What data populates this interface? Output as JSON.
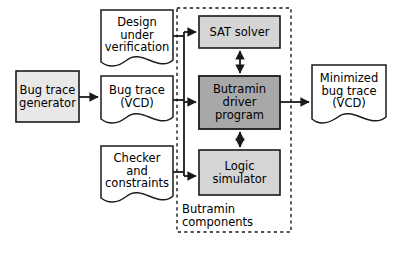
{
  "diagram": {
    "background_color": "#ffffff",
    "stroke_color": "#1a1a1a",
    "nodes": {
      "bug_trace_generator": {
        "label": "Bug trace\ngenerator",
        "shape": "rect",
        "fill": "#e8e8e8",
        "x": 16,
        "y": 71,
        "w": 63,
        "h": 51,
        "font_size": 11.5
      },
      "design_under_verification": {
        "label": "Design\nunder\nverification",
        "shape": "document",
        "fill": "#ffffff",
        "x": 101,
        "y": 10,
        "w": 72,
        "h": 56,
        "font_size": 11.5
      },
      "bug_trace_vcd": {
        "label": "Bug trace\n(VCD)",
        "shape": "document",
        "fill": "#ffffff",
        "x": 101,
        "y": 76,
        "w": 72,
        "h": 47,
        "font_size": 11.5
      },
      "checker_and_constraints": {
        "label": "Checker\nand\nconstraints",
        "shape": "document",
        "fill": "#ffffff",
        "x": 101,
        "y": 146,
        "w": 72,
        "h": 56,
        "font_size": 11.5
      },
      "sat_solver": {
        "label": "SAT solver",
        "shape": "rect",
        "fill": "#d5d5d5",
        "x": 199,
        "y": 16,
        "w": 81,
        "h": 32,
        "font_size": 11.5
      },
      "butramin_driver_program": {
        "label": "Butramin\ndriver\nprogram",
        "shape": "rect",
        "fill": "#a8a8a8",
        "x": 199,
        "y": 76,
        "w": 81,
        "h": 53,
        "font_size": 11.5
      },
      "logic_simulator": {
        "label": "Logic\nsimulator",
        "shape": "rect",
        "fill": "#d5d5d5",
        "x": 199,
        "y": 150,
        "w": 81,
        "h": 45,
        "font_size": 11.5
      },
      "minimized_bug_trace": {
        "label": "Minimized\nbug trace\n(VCD)",
        "shape": "document",
        "fill": "#ffffff",
        "x": 312,
        "y": 65,
        "w": 74,
        "h": 58,
        "font_size": 11.5
      }
    },
    "group": {
      "name": "butramin-components-group",
      "caption": "Butramin\ncomponents",
      "border_style": "dashed",
      "x": 177,
      "y": 8,
      "w": 114,
      "h": 224,
      "caption_x": 182,
      "caption_y": 203,
      "font_size": 11.5
    },
    "edges": [
      {
        "name": "generator-to-bugtrace",
        "from": "bug_trace_generator",
        "to": "bug_trace_vcd",
        "arrow": "single"
      },
      {
        "name": "inputs-bus-to-butramin",
        "from": "design_under_verification, bug_trace_vcd, checker_and_constraints",
        "to": "sat_solver, butramin_driver_program, logic_simulator",
        "arrow": "single"
      },
      {
        "name": "butramin-to-sat-solver",
        "from": "butramin_driver_program",
        "to": "sat_solver",
        "arrow": "double"
      },
      {
        "name": "butramin-to-logic-simulator",
        "from": "butramin_driver_program",
        "to": "logic_simulator",
        "arrow": "double"
      },
      {
        "name": "butramin-to-minimized-trace",
        "from": "butramin_driver_program",
        "to": "minimized_bug_trace",
        "arrow": "single"
      }
    ]
  }
}
